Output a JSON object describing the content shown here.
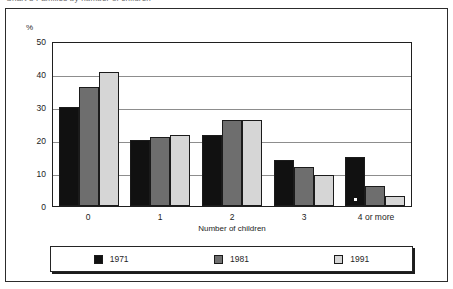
{
  "caption": {
    "text": "Chart 3  Families by number of children"
  },
  "chart_data": {
    "type": "bar",
    "title": "",
    "xlabel": "Number of children",
    "ylabel": "%",
    "categories": [
      "0",
      "1",
      "2",
      "3",
      "4 or more"
    ],
    "series": [
      {
        "name": "1971",
        "color": "#111111",
        "values": [
          30,
          20,
          21.5,
          14,
          15
        ]
      },
      {
        "name": "1981",
        "color": "#6e6e6e",
        "values": [
          36,
          21,
          26,
          11.7,
          6
        ]
      },
      {
        "name": "1991",
        "color": "#d6d6d6",
        "values": [
          40.5,
          21.5,
          26,
          9.5,
          3
        ]
      }
    ],
    "ylim": [
      0,
      50
    ],
    "yticks": [
      "0",
      "10",
      "20",
      "30",
      "40",
      "50"
    ],
    "grid": true,
    "legend_position": "bottom",
    "annotations": [
      {
        "series": "1971",
        "category": "4 or more",
        "marker": "asterisk"
      }
    ]
  },
  "legend": {
    "entries": [
      {
        "label": "1971",
        "swatch": "black-swatch"
      },
      {
        "label": "1981",
        "swatch": "dark-gray-swatch"
      },
      {
        "label": "1991",
        "swatch": "light-gray-swatch"
      }
    ]
  }
}
